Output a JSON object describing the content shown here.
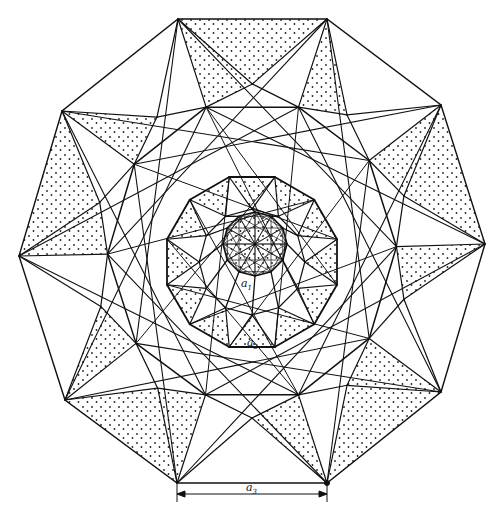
{
  "figure": {
    "type": "decagonal square-triangle tiling with stippled triangles",
    "colors": {
      "stroke": "#111111",
      "stipple": "#222222",
      "background": "#ffffff"
    },
    "outer_polygon": [
      [
        178,
        19
      ],
      [
        327,
        19
      ],
      [
        441,
        105
      ],
      [
        485,
        244
      ],
      [
        441,
        392
      ],
      [
        327,
        483
      ],
      [
        177,
        483
      ],
      [
        65,
        400
      ],
      [
        19,
        256
      ],
      [
        62,
        111
      ]
    ],
    "middle_ring_center": [
      252,
      262
    ],
    "middle_ring_radius": 88,
    "inner_ring_center": [
      255,
      244
    ],
    "inner_ring_radius": 32,
    "labels": [
      {
        "id": "a1",
        "base": "a",
        "sub": "1",
        "x": 241,
        "y": 284
      },
      {
        "id": "a2",
        "base": "a",
        "sub": "2",
        "x": 248,
        "y": 343
      },
      {
        "id": "a3",
        "base": "a",
        "sub": "3",
        "x": 247,
        "y": 490
      }
    ],
    "dimension_line": {
      "x1": 177,
      "x2": 327,
      "y": 494,
      "tick_top": 483,
      "tick_bottom": 502,
      "label": "a3"
    }
  }
}
